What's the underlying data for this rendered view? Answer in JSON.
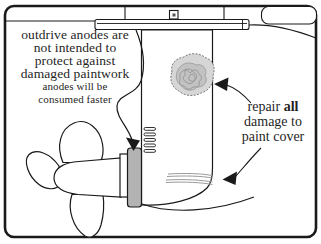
{
  "annotation_bubble": {
    "lines": [
      "outdrive anodes are",
      "not intended to",
      "protect against",
      "damaged paintwork"
    ],
    "note_lines": [
      "anodes will be",
      "consumed faster"
    ]
  },
  "repair_note": {
    "line1_pre": "repair ",
    "line1_bold": "all",
    "line2": "damage to",
    "line3": "paint cover"
  },
  "colors": {
    "ink": "#1a1a1a",
    "anode_gray": "#b3b3b3",
    "damage_spot_gray": "#d6d6d6",
    "stripe_gray": "#9a9a9a"
  },
  "icons": {
    "callout_arrowheads": "solid-triangle-arrowhead",
    "damage_spot": "scribbled-blob",
    "transom_bolt": "square-bolt"
  }
}
